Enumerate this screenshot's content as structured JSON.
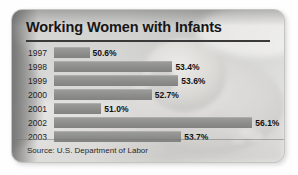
{
  "card": {
    "title": "Working Women with Infants",
    "source": "Source: U.S. Department of Labor"
  },
  "chart_data": {
    "type": "bar",
    "orientation": "horizontal",
    "title": "Working Women with Infants",
    "subtitle": "",
    "xlabel": "",
    "ylabel": "",
    "source": "Source: U.S. Department of Labor",
    "unit": "percent",
    "categories": [
      "1997",
      "1998",
      "1999",
      "2000",
      "2001",
      "2002",
      "2003"
    ],
    "values": [
      50.6,
      53.4,
      53.6,
      52.7,
      51.0,
      56.1,
      53.7
    ],
    "labels": [
      "50.6%",
      "53.4%",
      "53.6%",
      "52.7%",
      "51.0%",
      "56.1%",
      "53.7%"
    ],
    "xlim": [
      49.4,
      56.9
    ],
    "grid": false,
    "legend": false,
    "zero_based": false,
    "bar_color": "#8e8e8c",
    "text_color": "#111111"
  },
  "rows": [
    {
      "year": "1997",
      "value": 50.6,
      "label": "50.6%"
    },
    {
      "year": "1998",
      "value": 53.4,
      "label": "53.4%"
    },
    {
      "year": "1999",
      "value": 53.6,
      "label": "53.6%"
    },
    {
      "year": "2000",
      "value": 52.7,
      "label": "52.7%"
    },
    {
      "year": "2001",
      "value": 51.0,
      "label": "51.0%"
    },
    {
      "year": "2002",
      "value": 56.1,
      "label": "56.1%"
    },
    {
      "year": "2003",
      "value": 53.7,
      "label": "53.7%"
    }
  ]
}
